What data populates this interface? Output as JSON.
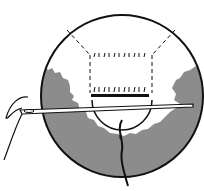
{
  "diagram": {
    "colors": {
      "line": "#111111",
      "fabric_shade": "#8c8c8c",
      "background": "#ffffff"
    }
  }
}
